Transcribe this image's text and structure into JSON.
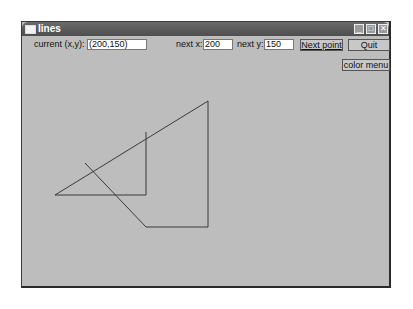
{
  "window": {
    "title": "lines",
    "controls": [
      "minimize",
      "maximize",
      "close"
    ]
  },
  "toolbar": {
    "current_label": "current (x,y):",
    "current_value": "(200,150)",
    "next_x_label": "next x:",
    "next_x_value": "200",
    "next_y_label": "next y:",
    "next_y_value": "150",
    "next_point_label": "Next point",
    "quit_label": "Quit",
    "color_menu_label": "color menu"
  },
  "canvas": {
    "line_color": "#3a3a3a",
    "background": "#bdbdbd",
    "polyline_points": "55,195 208,101 208,227 146,227 85,163",
    "segment_points": "55,195 146,195 146,132"
  }
}
